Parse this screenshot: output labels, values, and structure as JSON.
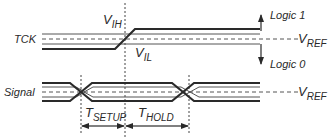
{
  "diagram": {
    "type": "timing-diagram",
    "colors": {
      "line": "#2a2a2a",
      "thin": "#555555",
      "background": "#ffffff"
    },
    "signals": [
      {
        "name": "TCK",
        "label": "TCK"
      },
      {
        "name": "Signal",
        "label": "Signal"
      }
    ],
    "labels": {
      "vih_main": "V",
      "vih_sub": "IH",
      "vil_main": "V",
      "vil_sub": "IL",
      "vref1_main": "V",
      "vref1_sub": "REF",
      "vref2_main": "V",
      "vref2_sub": "REF",
      "logic1": "Logic 1",
      "logic0": "Logic 0",
      "tsetup_main": "T",
      "tsetup_sub": "SETUP",
      "thold_main": "T",
      "thold_sub": "HOLD"
    }
  }
}
